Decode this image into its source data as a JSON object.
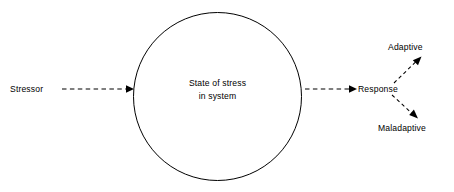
{
  "diagram": {
    "background_color": "#ffffff",
    "stroke_color": "#000000",
    "nodes": {
      "stressor": {
        "label": "Stressor",
        "x": 10,
        "y": 92
      },
      "state_of_stress": {
        "label_line_1": "State of stress",
        "label_line_2": "in system",
        "center_x": 217.5,
        "center_y": 96.5,
        "radius": 84
      },
      "response": {
        "label": "Response",
        "x": 358,
        "y": 92
      },
      "adaptive": {
        "label": "Adaptive",
        "x": 388,
        "y": 50
      },
      "maladaptive": {
        "label": "Maladaptive",
        "x": 378,
        "y": 131
      }
    },
    "connectors": [
      {
        "name": "stressor-to-state",
        "style": "dashed",
        "arrowhead": "filled-triangle",
        "from_x": 62,
        "from_y": 89,
        "to_x": 133,
        "to_y": 89
      },
      {
        "name": "state-to-response",
        "style": "dashed",
        "arrowhead": "filled-triangle",
        "from_x": 305,
        "from_y": 89,
        "to_x": 356,
        "to_y": 89
      },
      {
        "name": "response-to-adaptive",
        "style": "dashed",
        "arrowhead": "filled-triangle",
        "from_x": 394,
        "from_y": 83,
        "to_x": 421,
        "to_y": 57
      },
      {
        "name": "response-to-maladaptive",
        "style": "dashed",
        "arrowhead": "filled-triangle",
        "from_x": 392,
        "from_y": 95,
        "to_x": 417,
        "to_y": 118
      }
    ]
  }
}
